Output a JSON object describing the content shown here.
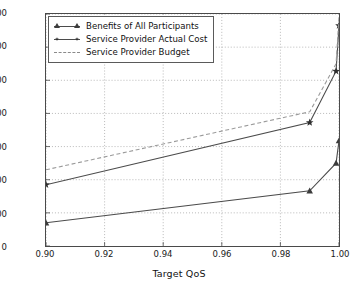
{
  "chart_data": {
    "type": "line",
    "title": "",
    "xlabel": "Target QoS",
    "ylabel": "",
    "xlim": [
      0.9,
      1.0
    ],
    "ylim": [
      0,
      1400
    ],
    "xticks": [
      0.9,
      0.92,
      0.94,
      0.96,
      0.98,
      1.0
    ],
    "xticklabels": [
      "0.90",
      "0.92",
      "0.94",
      "0.96",
      "0.98",
      "1.00"
    ],
    "yticks": [
      0,
      200,
      400,
      600,
      800,
      1000,
      1200,
      1400
    ],
    "yticklabels": [
      "0",
      "200",
      "400",
      "600",
      "800",
      "1000",
      "1200",
      "1400"
    ],
    "grid": true,
    "grid_style": "dotted",
    "legend_position": "upper left",
    "x": [
      0.9,
      0.99,
      0.999,
      1.0
    ],
    "series": [
      {
        "name": "Benefits of All Participants",
        "values": [
          140,
          333,
          500,
          635
        ],
        "marker": "triangle",
        "linestyle": "solid",
        "color": "#4b4b4b"
      },
      {
        "name": "Service Provider Actual Cost",
        "values": [
          370,
          745,
          1055,
          1330
        ],
        "marker": "star",
        "linestyle": "solid",
        "color": "#4b4b4b"
      },
      {
        "name": "Service Provider Budget",
        "values": [
          460,
          810,
          1100,
          1385
        ],
        "marker": "none",
        "linestyle": "dashed",
        "color": "#9a9a9a"
      }
    ]
  },
  "legend": {
    "items": [
      {
        "label": "Benefits of All Participants"
      },
      {
        "label": "Service Provider Actual Cost"
      },
      {
        "label": "Service Provider Budget"
      }
    ]
  }
}
